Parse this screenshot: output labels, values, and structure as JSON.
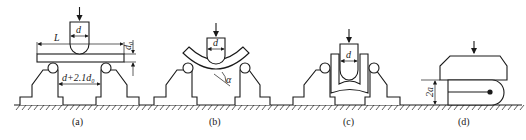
{
  "figure": {
    "panels": [
      {
        "id": "a",
        "caption": "(a)",
        "labels": {
          "span": "L",
          "mandrel_diameter": "d",
          "thickness": "d₀",
          "support_gap": "d+2.1d₀"
        }
      },
      {
        "id": "b",
        "caption": "(b)",
        "labels": {
          "mandrel_diameter": "d",
          "bend_angle": "α"
        }
      },
      {
        "id": "c",
        "caption": "(c)",
        "labels": {
          "mandrel_diameter": "d"
        }
      },
      {
        "id": "d",
        "caption": "(d)",
        "labels": {
          "gap": "2a"
        }
      }
    ],
    "colors": {
      "line": "#1a1a1a",
      "background": "#ffffff"
    }
  }
}
